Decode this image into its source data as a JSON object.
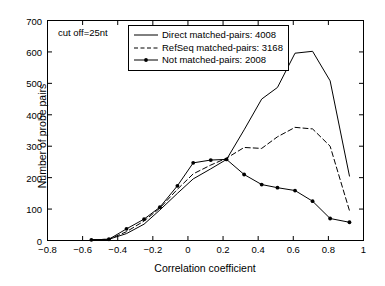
{
  "annotation": "cut off=25nt",
  "axes": {
    "xlabel": "Correlation coefficient",
    "ylabel": "Number of probe pairs",
    "xticks": [
      "-0.8",
      "-0.6",
      "-0.4",
      "-0.2",
      "0",
      "0.2",
      "0.4",
      "0.6",
      "0.8",
      "1"
    ],
    "yticks": [
      "0",
      "100",
      "200",
      "300",
      "400",
      "500",
      "600",
      "700"
    ]
  },
  "legend": {
    "items": [
      {
        "label": "Direct matched-pairs: 4008",
        "style": "solid"
      },
      {
        "label": "RefSeq matched-pairs: 3168",
        "style": "dashed"
      },
      {
        "label": "Not matched-pairs: 2008",
        "style": "solid-marker"
      }
    ]
  },
  "chart_data": {
    "type": "line",
    "title": "",
    "xlabel": "Correlation coefficient",
    "ylabel": "Number of probe pairs",
    "xlim": [
      -0.8,
      1.0
    ],
    "ylim": [
      0,
      700
    ],
    "xtick_step": 0.2,
    "ytick_step": 100,
    "grid": false,
    "legend_position": "top-center",
    "annotation": "cut off=25nt",
    "series": [
      {
        "name": "Direct matched-pairs: 4008",
        "total": 4008,
        "style": "solid",
        "markers": false,
        "x": [
          -0.55,
          -0.45,
          -0.35,
          -0.25,
          -0.16,
          -0.06,
          0.03,
          0.13,
          0.22,
          0.32,
          0.42,
          0.51,
          0.61,
          0.71,
          0.81,
          0.92
        ],
        "y": [
          2,
          4,
          22,
          52,
          97,
          150,
          196,
          228,
          258,
          352,
          450,
          487,
          596,
          602,
          508,
          205
        ]
      },
      {
        "name": "RefSeq matched-pairs: 3168",
        "total": 3168,
        "style": "dashed",
        "markers": false,
        "x": [
          -0.55,
          -0.45,
          -0.35,
          -0.25,
          -0.16,
          -0.06,
          0.03,
          0.13,
          0.22,
          0.32,
          0.42,
          0.51,
          0.61,
          0.71,
          0.81,
          0.92
        ],
        "y": [
          2,
          4,
          28,
          62,
          103,
          163,
          212,
          240,
          262,
          296,
          293,
          330,
          360,
          355,
          300,
          95
        ]
      },
      {
        "name": "Not matched-pairs: 2008",
        "total": 2008,
        "style": "solid-marker",
        "markers": true,
        "x": [
          -0.55,
          -0.45,
          -0.35,
          -0.25,
          -0.16,
          -0.06,
          0.03,
          0.13,
          0.22,
          0.32,
          0.42,
          0.51,
          0.61,
          0.71,
          0.81,
          0.92
        ],
        "y": [
          2,
          4,
          37,
          68,
          106,
          174,
          247,
          256,
          258,
          210,
          178,
          168,
          159,
          125,
          70,
          58
        ]
      }
    ]
  }
}
